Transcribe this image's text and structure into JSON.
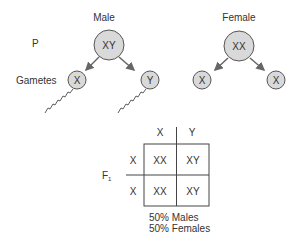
{
  "generation_labels": {
    "parent": "P",
    "gametes": "Gametes",
    "f1": "F",
    "f1_sub": "1"
  },
  "parents": {
    "male": {
      "label": "Male",
      "genotype": "XY",
      "gametes": [
        "X",
        "Y"
      ]
    },
    "female": {
      "label": "Female",
      "genotype": "XX",
      "gametes": [
        "X",
        "X"
      ]
    }
  },
  "punnett": {
    "col_headers": [
      "X",
      "Y"
    ],
    "row_headers": [
      "X",
      "X"
    ],
    "cells": [
      [
        "XX",
        "XY"
      ],
      [
        "XX",
        "XY"
      ]
    ]
  },
  "result": {
    "line1": "50% Males",
    "line2": "50% Females"
  },
  "colors": {
    "circle_fill": "#d9d9d9",
    "stroke": "#555555",
    "arrow": "#666666"
  }
}
